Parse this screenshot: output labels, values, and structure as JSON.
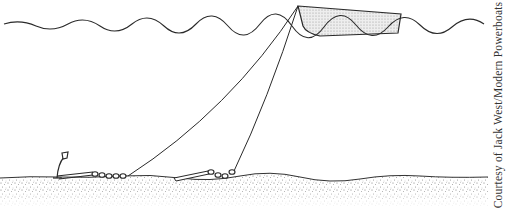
{
  "figure": {
    "credit": "Courtesy of Jack West/Modern Powerboats",
    "elements": {
      "water_surface": "wavy-water-line",
      "boat": "boat-hull",
      "rodes": [
        "rode-to-primary-anchor",
        "rode-to-secondary-anchor"
      ],
      "anchors": [
        "primary-anchor",
        "secondary-anchor"
      ],
      "chains": [
        "primary-anchor-chain",
        "secondary-anchor-chain"
      ],
      "seabed": "sandy-seabed"
    },
    "colors": {
      "line": "#2a2a2a",
      "hull_fill": "#dcdcdc",
      "sand": "#9a9a9a"
    }
  }
}
